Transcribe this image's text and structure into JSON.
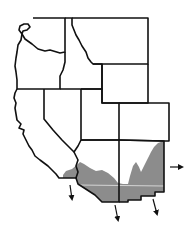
{
  "map": {
    "title": "",
    "region": "Western United States",
    "colors": {
      "background": "#ffffff",
      "border": "#111111",
      "range_fill": "#8c8c8c",
      "highlight_line": "#e6e6e6"
    },
    "states": [
      {
        "id": "washington"
      },
      {
        "id": "oregon"
      },
      {
        "id": "california"
      },
      {
        "id": "idaho"
      },
      {
        "id": "nevada"
      },
      {
        "id": "montana"
      },
      {
        "id": "wyoming"
      },
      {
        "id": "utah"
      },
      {
        "id": "colorado"
      },
      {
        "id": "arizona"
      },
      {
        "id": "new-mexico"
      }
    ],
    "shaded_region": {
      "label": "",
      "description": "range across southern California, Arizona and New Mexico"
    },
    "arrows": [
      {
        "id": "arrow-east",
        "direction": "east"
      },
      {
        "id": "arrow-south-california",
        "direction": "south"
      },
      {
        "id": "arrow-south-arizona",
        "direction": "south"
      },
      {
        "id": "arrow-south-new-mexico",
        "direction": "south"
      }
    ]
  }
}
